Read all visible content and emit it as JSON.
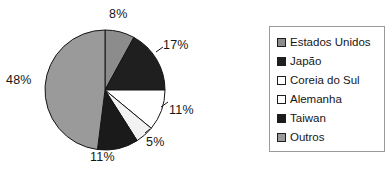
{
  "chart_data": {
    "type": "pie",
    "title": "",
    "categories": [
      "Estados Unidos",
      "Japão",
      "Coreia do Sul",
      "Alemanha",
      "Taiwan",
      "Outros"
    ],
    "values": [
      8,
      17,
      11,
      5,
      11,
      48
    ],
    "value_labels": [
      "8%",
      "17%",
      "11%",
      "5%",
      "11%",
      "48%"
    ],
    "unit": "%",
    "colors": [
      "#8c8c8c",
      "#1f1f1f",
      "#ffffff",
      "#f2f2f2",
      "#1a1a1a",
      "#9a9a9a"
    ],
    "slice_order": "clockwise from 12 o'clock",
    "legend_position": "right",
    "grid": false,
    "xlabel": "",
    "ylabel": ""
  },
  "labels": {
    "estados_unidos": "8%",
    "japao": "17%",
    "coreia_do_sul": "11%",
    "alemanha": "5%",
    "taiwan": "11%",
    "outros": "48%"
  },
  "legend": {
    "items": [
      {
        "label": "Estados Unidos",
        "color": "#8c8c8c"
      },
      {
        "label": "Japão",
        "color": "#1f1f1f"
      },
      {
        "label": "Coreia do Sul",
        "color": "#ffffff"
      },
      {
        "label": "Alemanha",
        "color": "#ffffff"
      },
      {
        "label": "Taiwan",
        "color": "#1a1a1a"
      },
      {
        "label": "Outros",
        "color": "#9a9a9a"
      }
    ]
  }
}
